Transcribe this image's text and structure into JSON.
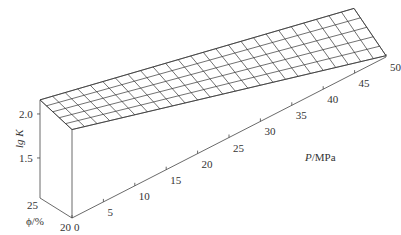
{
  "chart_data": {
    "type": "surface3d",
    "title": "",
    "xlabel": "P/MPa",
    "ylabel": "φ/%",
    "zlabel": "lg K",
    "x_axis": {
      "label": "P/MPa",
      "ticks": [
        0,
        5,
        10,
        15,
        20,
        25,
        30,
        35,
        40,
        45,
        50
      ],
      "range": [
        0,
        50
      ]
    },
    "y_axis": {
      "label": "φ/%",
      "ticks": [
        20,
        25
      ],
      "range": [
        20,
        25
      ]
    },
    "z_axis": {
      "label": "lg K",
      "ticks": [
        1.5,
        2.0
      ],
      "range": [
        1.05,
        2.2
      ]
    },
    "grid": {
      "p_divisions": 25,
      "phi_divisions": 5
    },
    "surface_corners": [
      {
        "P": 0,
        "phi": 20,
        "lgK": 2.05
      },
      {
        "P": 0,
        "phi": 25,
        "lgK": 2.16
      },
      {
        "P": 50,
        "phi": 20,
        "lgK": 1.06
      },
      {
        "P": 50,
        "phi": 25,
        "lgK": 1.37
      }
    ],
    "note": "lg K decreases approximately linearly with P and increases slightly with φ"
  },
  "labels": {
    "z_axis_title": "lg K",
    "z_tick_2": "2.0",
    "z_tick_15": "1.5",
    "phi_title": "ϕ/%",
    "phi_tick_25": "25",
    "phi_tick_20": "20",
    "p_title_italic": "P",
    "p_title_unit": "/MPa",
    "p_ticks": [
      "0",
      "5",
      "10",
      "15",
      "20",
      "25",
      "30",
      "35",
      "40",
      "45",
      "50"
    ]
  }
}
